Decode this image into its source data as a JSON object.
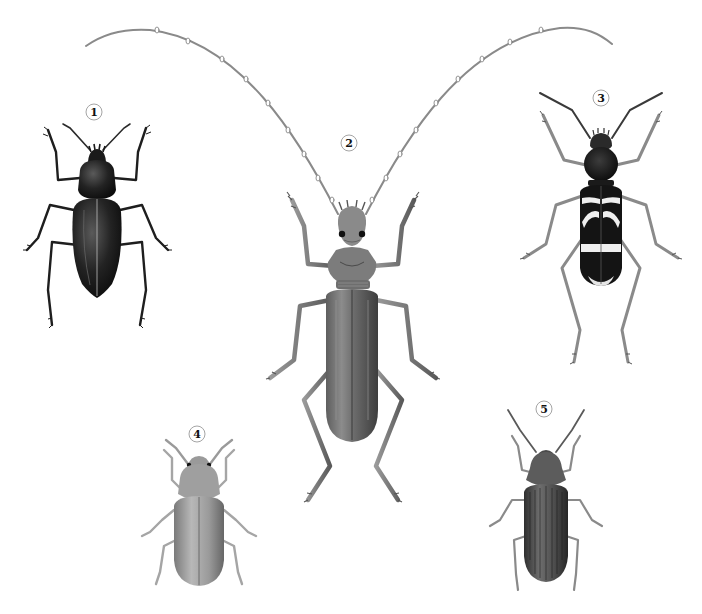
{
  "plate": {
    "width": 702,
    "height": 614,
    "background": "#ffffff"
  },
  "specimens": [
    {
      "number": "1",
      "label_pos": [
        94,
        112
      ],
      "description": "dark glossy ground beetle with oval elytra",
      "tone": "#1e1e1e"
    },
    {
      "number": "2",
      "label_pos": [
        349,
        143
      ],
      "description": "longhorn beetle with very long arching antennae and elongate grey elytra",
      "tone": "#6b6b6b"
    },
    {
      "number": "3",
      "label_pos": [
        601,
        98
      ],
      "description": "wasp-mimic longhorn beetle with black elytra and pale transverse bands",
      "tone": "#141414"
    },
    {
      "number": "4",
      "label_pos": [
        197,
        434
      ],
      "description": "small pale oval beetle",
      "tone": "#8f8f8f"
    },
    {
      "number": "5",
      "label_pos": [
        544,
        409
      ],
      "description": "dark-grey beetle with striate elytra",
      "tone": "#4a4a4a"
    }
  ]
}
